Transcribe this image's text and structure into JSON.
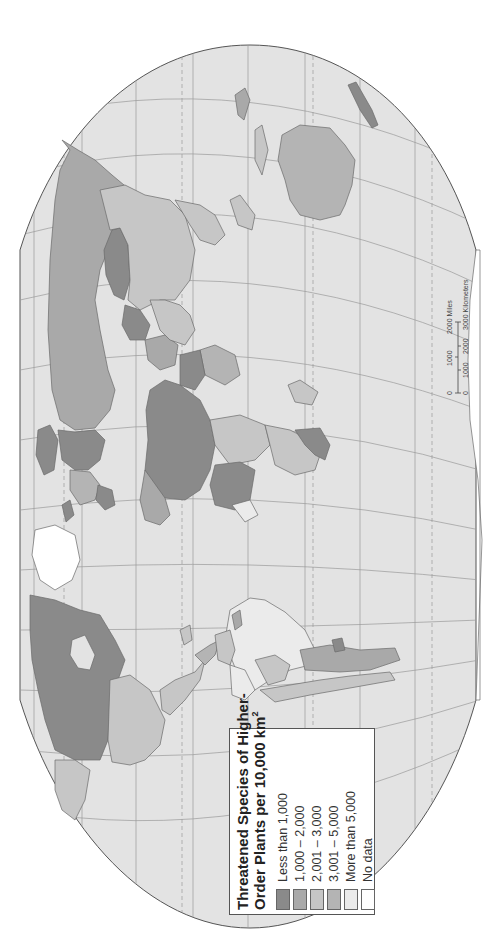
{
  "map": {
    "orientation": "rotated 90° counter-clockwise (north to the left)",
    "colors": {
      "background": "#ffffff",
      "ocean": "#e3e3e3",
      "graticule": "#9a9a9a",
      "border": "#6a6a6a"
    }
  },
  "legend": {
    "title_line1": "Threatened Species of Higher-",
    "title_line2": "Order Plants per 10,000 km",
    "title_sup": "2",
    "items": [
      {
        "label": "Less than 1,000",
        "color": "#8a8a8a"
      },
      {
        "label": "1,000 – 2,000",
        "color": "#a9a9a9"
      },
      {
        "label": "2,001 – 3,000",
        "color": "#c6c6c6"
      },
      {
        "label": "3,001 – 5,000",
        "color": "#b4b4b4"
      },
      {
        "label": "More than 5,000",
        "color": "#ebebeb"
      },
      {
        "label": "No data",
        "color": "#ffffff"
      }
    ]
  },
  "scale_bar": {
    "miles_ticks": [
      "0",
      "1000",
      "2000 Miles"
    ],
    "km_ticks": [
      "0",
      "1000",
      "2000",
      "3000 Kilometers"
    ]
  },
  "regions": [
    {
      "name": "Russia",
      "class": "1,000 – 2,000"
    },
    {
      "name": "Canada",
      "class": "Less than 1,000"
    },
    {
      "name": "United States",
      "class": "2,001 – 3,000"
    },
    {
      "name": "Mexico",
      "class": "2,001 – 3,000"
    },
    {
      "name": "Brazil",
      "class": "More than 5,000"
    },
    {
      "name": "Argentina",
      "class": "1,000 – 2,000"
    },
    {
      "name": "Australia",
      "class": "3,001 – 5,000"
    },
    {
      "name": "China",
      "class": "2,001 – 3,000"
    },
    {
      "name": "Kazakhstan",
      "class": "Less than 1,000"
    },
    {
      "name": "Greenland",
      "class": "No data"
    },
    {
      "name": "Sahara/North Africa",
      "class": "Less than 1,000"
    },
    {
      "name": "India",
      "class": "2,001 – 3,000"
    }
  ]
}
